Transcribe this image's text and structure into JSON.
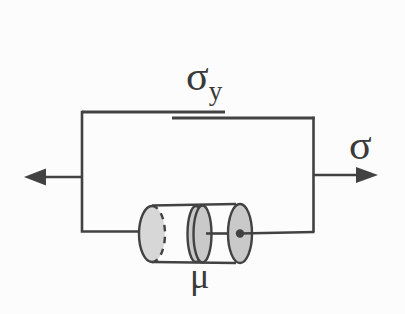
{
  "figure": {
    "kind": "mechanical-model-diagram",
    "components": [
      "friction-slider",
      "viscous-dashpot",
      "left-stress-arrow",
      "right-stress-arrow"
    ]
  },
  "labels": {
    "yield_stress": {
      "base": "σ",
      "subscript": "y"
    },
    "applied_stress": "σ",
    "viscosity": "μ"
  },
  "colors": {
    "line": "#424242",
    "text": "#3a3a3a",
    "cylinder_end_fill": "#d7d7d7",
    "piston_fill": "#c9c9c9",
    "background": "#fcfcfc"
  }
}
